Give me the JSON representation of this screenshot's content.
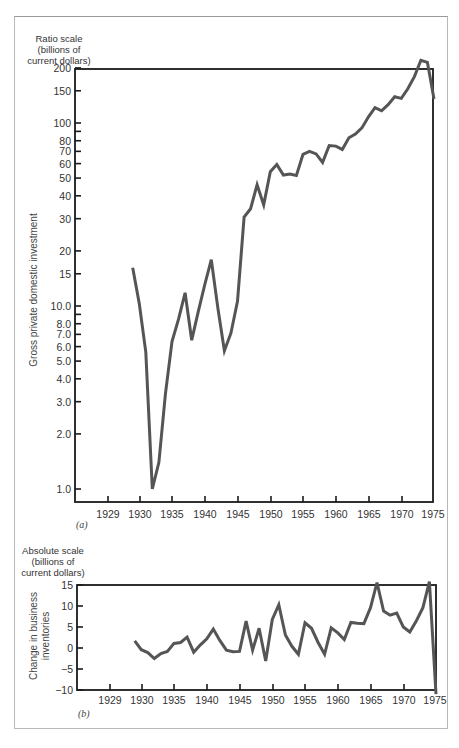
{
  "chart_data": [
    {
      "type": "line",
      "panel_label": "(a)",
      "title": "",
      "ylabel": "Gross private domestic investment",
      "yunit_lines": [
        "Ratio scale",
        "(billions of",
        "current dollars)"
      ],
      "yscale": "log",
      "ylim": [
        0.8,
        200
      ],
      "yticks": [
        "200",
        "150",
        "100",
        "80",
        "70",
        "60",
        "50",
        "40",
        "30",
        "20",
        "15",
        "10.0",
        "8.0",
        "7.0",
        "6.0",
        "5.0",
        "4.0",
        "3.0",
        "2.0",
        "1.0"
      ],
      "ytick_values": [
        200,
        150,
        100,
        80,
        70,
        60,
        50,
        40,
        30,
        20,
        15,
        10,
        8,
        7,
        6,
        5,
        4,
        3,
        2,
        1
      ],
      "xticks": [
        "1929",
        "1930",
        "1935",
        "1940",
        "1945",
        "1950",
        "1955",
        "1960",
        "1965",
        "1970",
        "1975"
      ],
      "xlabel": "",
      "grid": false,
      "series": [
        {
          "name": "Gross private domestic investment",
          "x": [
            1929,
            1930,
            1931,
            1932,
            1933,
            1934,
            1935,
            1936,
            1937,
            1938,
            1939,
            1940,
            1941,
            1942,
            1943,
            1944,
            1945,
            1946,
            1947,
            1948,
            1949,
            1950,
            1951,
            1952,
            1953,
            1954,
            1955,
            1956,
            1957,
            1958,
            1959,
            1960,
            1961,
            1962,
            1963,
            1964,
            1965,
            1966,
            1967,
            1968,
            1969,
            1970,
            1971,
            1972,
            1973,
            1974,
            1975
          ],
          "values": [
            16.2,
            10.3,
            5.6,
            1.0,
            1.4,
            3.3,
            6.4,
            8.5,
            11.8,
            6.5,
            9.3,
            13.1,
            17.9,
            9.8,
            5.7,
            7.1,
            10.6,
            30.6,
            34.0,
            46.0,
            35.7,
            54.1,
            59.3,
            51.9,
            52.6,
            51.7,
            67.4,
            70.0,
            67.8,
            60.9,
            75.3,
            74.8,
            71.7,
            83.0,
            87.1,
            94.0,
            108.1,
            121.4,
            116.6,
            126.0,
            139.0,
            136.3,
            153.7,
            179.3,
            220.0,
            214.6,
            135.0
          ]
        }
      ]
    },
    {
      "type": "line",
      "panel_label": "(b)",
      "title": "",
      "ylabel": "Change in business inventories",
      "ylabel_lines": [
        "Change in business",
        "inventories"
      ],
      "yunit_lines": [
        "Absolute scale",
        "(billions of",
        "current dollars)"
      ],
      "yscale": "linear",
      "ylim": [
        -10,
        15
      ],
      "yticks": [
        "15",
        "10",
        "5",
        "0",
        "−5",
        "−10"
      ],
      "ytick_values": [
        15,
        10,
        5,
        0,
        -5,
        -10
      ],
      "xticks": [
        "1929",
        "1930",
        "1935",
        "1940",
        "1945",
        "1950",
        "1955",
        "1960",
        "1965",
        "1970",
        "1975"
      ],
      "xlabel": "",
      "grid": false,
      "series": [
        {
          "name": "Change in business inventories",
          "x": [
            1929,
            1930,
            1931,
            1932,
            1933,
            1934,
            1935,
            1936,
            1937,
            1938,
            1939,
            1940,
            1941,
            1942,
            1943,
            1944,
            1945,
            1946,
            1947,
            1948,
            1949,
            1950,
            1951,
            1952,
            1953,
            1954,
            1955,
            1956,
            1957,
            1958,
            1959,
            1960,
            1961,
            1962,
            1963,
            1964,
            1965,
            1966,
            1967,
            1968,
            1969,
            1970,
            1971,
            1972,
            1973,
            1974,
            1975
          ],
          "values": [
            1.7,
            -0.4,
            -1.1,
            -2.5,
            -1.3,
            -0.8,
            1.1,
            1.3,
            2.6,
            -1.0,
            0.7,
            2.2,
            4.5,
            1.8,
            -0.5,
            -0.9,
            -0.8,
            6.4,
            -0.5,
            4.7,
            -3.1,
            6.8,
            10.3,
            3.1,
            0.4,
            -1.5,
            6.0,
            4.7,
            1.3,
            -1.5,
            4.8,
            3.6,
            2.0,
            6.1,
            5.9,
            5.8,
            9.6,
            15.6,
            8.8,
            7.8,
            8.3,
            5.0,
            3.8,
            6.5,
            9.6,
            15.8,
            -11.0
          ]
        }
      ]
    }
  ]
}
